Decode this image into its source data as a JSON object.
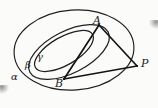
{
  "figure": {
    "type": "geometry-diagram",
    "background_color": "#fbfbfa",
    "stroke_color": "#1a1a1a",
    "labels": [
      {
        "id": "alpha",
        "text": "α",
        "kind": "plane-label",
        "x": 11,
        "y": 72,
        "size": "small"
      },
      {
        "id": "beta",
        "text": "β",
        "kind": "plane-label",
        "x": 25,
        "y": 60,
        "size": "small"
      },
      {
        "id": "gamma",
        "text": "γ",
        "kind": "plane-label",
        "x": 37,
        "y": 52,
        "size": "small"
      },
      {
        "id": "A",
        "text": "A",
        "kind": "point-label",
        "x": 93,
        "y": 15,
        "size": "normal"
      },
      {
        "id": "B",
        "text": "B",
        "kind": "point-label",
        "x": 55,
        "y": 78,
        "size": "normal"
      },
      {
        "id": "P",
        "text": "P",
        "kind": "point-label",
        "x": 141,
        "y": 58,
        "size": "normal"
      }
    ],
    "ellipses": [
      {
        "id": "alpha-ellipse",
        "name": "outer-plane-alpha",
        "cx": 74,
        "cy": 50,
        "rx": 60,
        "ry": 40,
        "rotation": -4
      },
      {
        "id": "beta-ellipse",
        "name": "middle-plane-beta",
        "cx": 69,
        "cy": 52,
        "rx": 44,
        "ry": 21,
        "rotation": -27
      },
      {
        "id": "gamma-ellipse",
        "name": "inner-plane-gamma",
        "cx": 64,
        "cy": 51,
        "rx": 33,
        "ry": 14,
        "rotation": -30
      }
    ],
    "points": [
      {
        "id": "A",
        "x": 99,
        "y": 25
      },
      {
        "id": "B",
        "x": 64,
        "y": 79
      },
      {
        "id": "P",
        "x": 137,
        "y": 66
      }
    ],
    "segments": [
      {
        "id": "AP",
        "from": "A",
        "to": "P",
        "label": "segment-a-p"
      },
      {
        "id": "BP",
        "from": "B",
        "to": "P",
        "label": "segment-b-p"
      },
      {
        "id": "AB",
        "from": "A",
        "to": "B",
        "label": "segment-a-b"
      }
    ]
  }
}
